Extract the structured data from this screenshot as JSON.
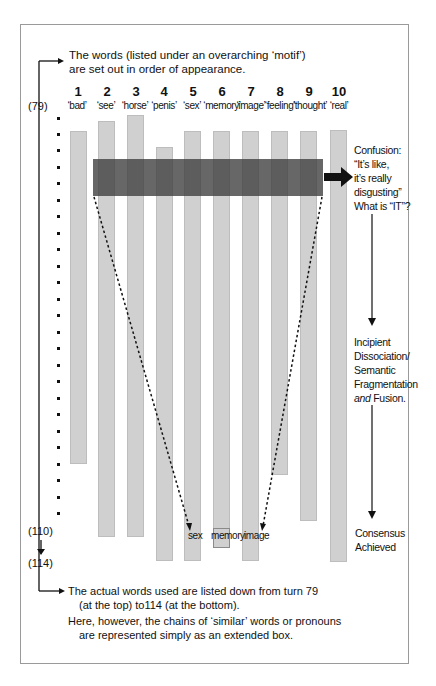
{
  "header": {
    "line1": "The words (listed under an overarching ‘motif’)",
    "line2": "are set out in order of appearance."
  },
  "columns": [
    {
      "num": "1",
      "word": "‘bad’",
      "top": 131,
      "bottom": 464,
      "x": 70
    },
    {
      "num": "2",
      "word": "‘see’",
      "top": 121,
      "bottom": 537,
      "x": 98
    },
    {
      "num": "3",
      "word": "‘horse’",
      "top": 115,
      "bottom": 537,
      "x": 127
    },
    {
      "num": "4",
      "word": "‘penis’",
      "top": 147,
      "bottom": 561,
      "x": 156
    },
    {
      "num": "5",
      "word": "‘sex’",
      "top": 131,
      "bottom": 561,
      "x": 184
    },
    {
      "num": "6",
      "word": "‘memory’",
      "top": 131,
      "bottom": 548,
      "x": 213
    },
    {
      "num": "7",
      "word": "‘image’",
      "top": 131,
      "bottom": 561,
      "x": 242
    },
    {
      "num": "8",
      "word": "‘feeling’",
      "top": 131,
      "bottom": 475,
      "x": 271
    },
    {
      "num": "9",
      "word": "‘thought’",
      "top": 131,
      "bottom": 521,
      "x": 300
    },
    {
      "num": "10",
      "word": "‘real’",
      "top": 130,
      "bottom": 562,
      "x": 330
    }
  ],
  "turns": {
    "start": "(79)",
    "end_shown": "(110)",
    "end": "(114)"
  },
  "annotations": {
    "confusion": [
      "Confusion:",
      "“It’s like,",
      "it’s really",
      "disgusting”",
      "What is “IT”?"
    ],
    "dissociation": [
      "Incipient",
      "Dissociation/",
      "Semantic",
      "Fragmentation"
    ],
    "fusion_italic": "and",
    "fusion_rest": " Fusion.",
    "consensus": [
      "Consensus",
      "Achieved"
    ]
  },
  "bottom_labels": {
    "sex": "sex",
    "memory": "memory",
    "image": "image"
  },
  "footer": {
    "line1": "The actual words used are listed down from turn 79",
    "line2": "(at the top) to114 (at the bottom).",
    "line3": "Here, however, the chains of ‘similar’ words or pronouns",
    "line4": "are represented simply as an extended box."
  },
  "colors": {
    "bar_fill": "#d0d0d0",
    "band_fill": "#3c3c3c",
    "line": "#111111"
  }
}
